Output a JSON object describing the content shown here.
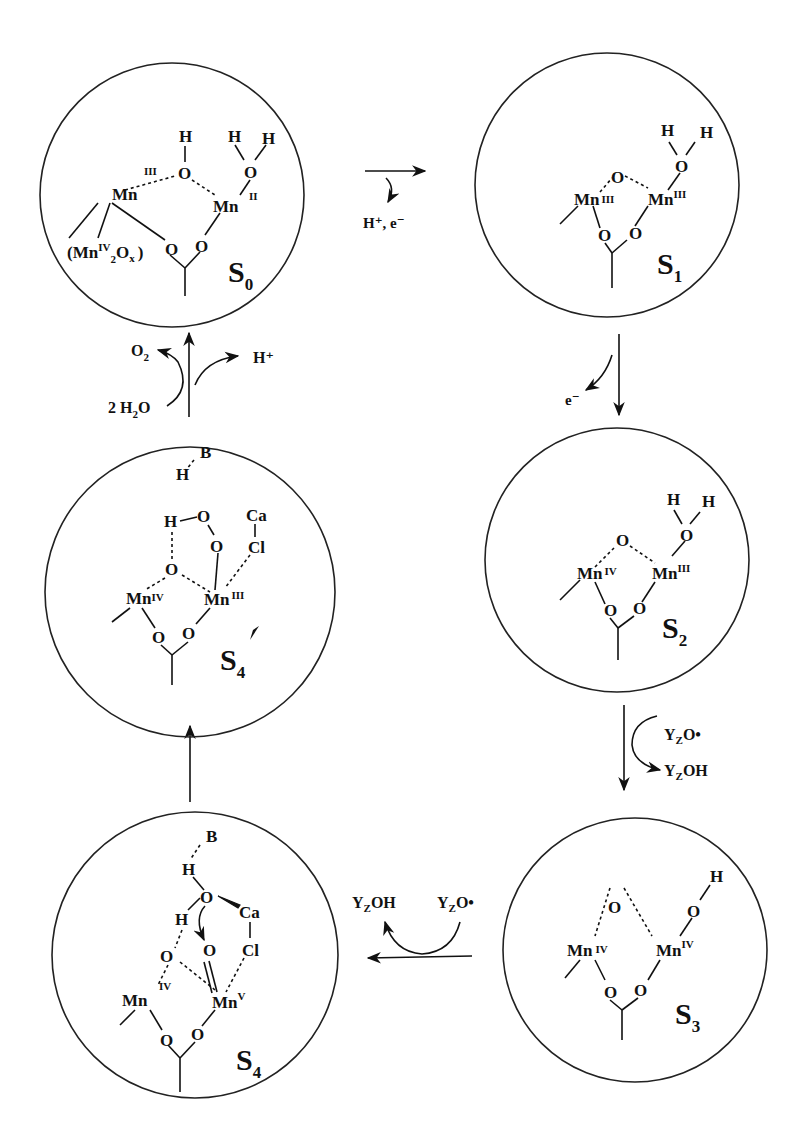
{
  "diagram": {
    "type": "reaction-cycle",
    "states": [
      {
        "id": "S0",
        "label": "S",
        "sub": "0",
        "atoms": {
          "mn_left": "Mn",
          "mn_left_ox": "III",
          "mn_right": "Mn",
          "mn_right_ox": "II",
          "bridge_o": "O",
          "bridge_h": "H",
          "water_o": "O",
          "water_h1": "H",
          "water_h2": "H",
          "carboxylate_o1": "O",
          "carboxylate_o2": "O",
          "cluster_note_prefix": "(Mn",
          "cluster_note_ox": "IV",
          "cluster_note_sub": "2",
          "cluster_note_o": "O",
          "cluster_note_x": "x",
          "cluster_note_suffix": ")"
        }
      },
      {
        "id": "S1",
        "label": "S",
        "sub": "1",
        "atoms": {
          "mn_left": "Mn",
          "mn_left_ox": "III",
          "mn_right": "Mn",
          "mn_right_ox": "III",
          "bridge_o": "O",
          "water_o": "O",
          "water_h1": "H",
          "water_h2": "H",
          "carboxylate_o1": "O",
          "carboxylate_o2": "O"
        }
      },
      {
        "id": "S2",
        "label": "S",
        "sub": "2",
        "atoms": {
          "mn_left": "Mn",
          "mn_left_ox": "IV",
          "mn_right": "Mn",
          "mn_right_ox": "III",
          "bridge_o": "O",
          "water_o": "O",
          "water_h1": "H",
          "water_h2": "H",
          "carboxylate_o1": "O",
          "carboxylate_o2": "O"
        }
      },
      {
        "id": "S3",
        "label": "S",
        "sub": "3",
        "atoms": {
          "mn_left": "Mn",
          "mn_left_ox": "IV",
          "mn_right": "Mn",
          "mn_right_ox": "IV",
          "bridge_o": "O",
          "hydroxo_o": "O",
          "hydroxo_h": "H",
          "carboxylate_o1": "O",
          "carboxylate_o2": "O"
        }
      },
      {
        "id": "S4",
        "label": "S",
        "sub": "4",
        "atoms": {
          "mn_left": "Mn",
          "mn_left_ox": "IV",
          "mn_right": "Mn",
          "mn_right_ox": "V",
          "base": "B",
          "water_h": "H",
          "water_o": "O",
          "water_h2": "H",
          "oxo_o": "O",
          "bridge_o": "O",
          "ca": "Ca",
          "cl": "Cl",
          "carboxylate_o1": "O",
          "carboxylate_o2": "O"
        }
      },
      {
        "id": "S4prime",
        "label": "S",
        "sub": "4",
        "prime": "'",
        "atoms": {
          "mn_left": "Mn",
          "mn_left_ox": "IV",
          "mn_right": "Mn",
          "mn_right_ox": "III",
          "base": "B",
          "base_h": "H",
          "peroxo_h": "H",
          "peroxo_o1": "O",
          "peroxo_o2": "O",
          "bridge_o": "O",
          "ca": "Ca",
          "cl": "Cl",
          "carboxylate_o1": "O",
          "carboxylate_o2": "O"
        }
      }
    ],
    "transitions": [
      {
        "from": "S0",
        "to": "S1",
        "release": "H⁺, e⁻"
      },
      {
        "from": "S1",
        "to": "S2",
        "release": "e⁻"
      },
      {
        "from": "S2",
        "to": "S3",
        "in": "Y",
        "in_sub": "Z",
        "in_suffix": "O•",
        "out": "Y",
        "out_sub": "Z",
        "out_suffix": "OH"
      },
      {
        "from": "S3",
        "to": "S4",
        "in": "Y",
        "in_sub": "Z",
        "in_suffix": "O•",
        "out": "Y",
        "out_sub": "Z",
        "out_suffix": "OH"
      },
      {
        "from": "S4",
        "to": "S4prime"
      },
      {
        "from": "S4prime",
        "to": "S0",
        "substrate": "2 H",
        "substrate_sub": "2",
        "substrate_suffix": "O",
        "product": "O",
        "product_sub": "2",
        "release": "H⁺"
      }
    ]
  }
}
